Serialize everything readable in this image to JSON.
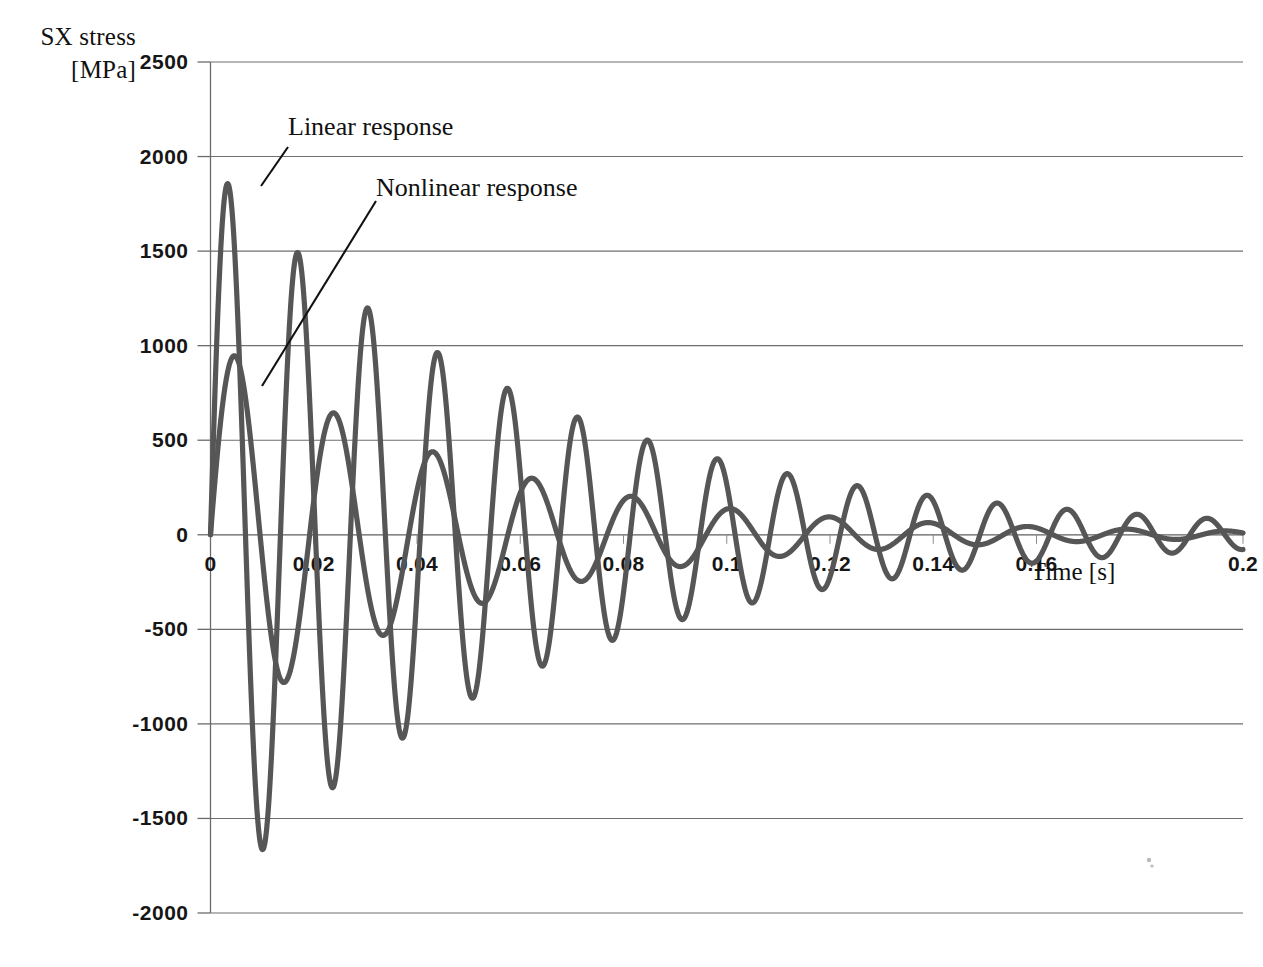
{
  "axes": {
    "y_title_line1": "SX stress",
    "y_title_line2": "[MPa]",
    "x_title": "Time [s]",
    "y_ticks": [
      "2500",
      "2000",
      "1500",
      "1000",
      "500",
      "0",
      "-500",
      "-1000",
      "-1500",
      "-2000"
    ],
    "x_ticks": [
      "0",
      "0.02",
      "0.04",
      "0.06",
      "0.08",
      "0.1",
      "0.12",
      "0.14",
      "0.16",
      "0.2"
    ]
  },
  "annotations": {
    "linear": "Linear response",
    "nonlinear": "Nonlinear response"
  },
  "chart_data": {
    "type": "line",
    "title": "",
    "xlabel": "Time [s]",
    "ylabel": "SX stress [MPa]",
    "xlim": [
      0,
      0.2
    ],
    "ylim": [
      -2000,
      2500
    ],
    "xtick_values": [
      0,
      0.02,
      0.04,
      0.06,
      0.08,
      0.1,
      0.12,
      0.14,
      0.16,
      0.2
    ],
    "ytick_values": [
      2500,
      2000,
      1500,
      1000,
      500,
      0,
      -500,
      -1000,
      -1500,
      -2000
    ],
    "grid": "horizontal",
    "legend": "annotations with leader lines",
    "line_color": "#565656",
    "series": [
      {
        "name": "Linear response",
        "model": "damped_sine",
        "amplitude0": 1960,
        "period": 0.01355,
        "damping_time_constant": 0.062,
        "phase_deg": 0,
        "peaks": [
          {
            "t": 0.0095,
            "y": 1840
          },
          {
            "t": 0.0233,
            "y": -1570
          },
          {
            "t": 0.0302,
            "y": 1345
          },
          {
            "t": 0.0437,
            "y": -1145
          },
          {
            "t": 0.0438,
            "y": 1000
          },
          {
            "t": 0.0575,
            "y": -855
          },
          {
            "t": 0.0574,
            "y": 730
          },
          {
            "t": 0.071,
            "y": -630
          },
          {
            "t": 0.0708,
            "y": 535
          },
          {
            "t": 0.0845,
            "y": -455
          },
          {
            "t": 0.0845,
            "y": 390
          },
          {
            "t": 0.098,
            "y": -335
          },
          {
            "t": 0.098,
            "y": 285
          },
          {
            "t": 0.1115,
            "y": -240
          },
          {
            "t": 0.1118,
            "y": 205
          },
          {
            "t": 0.125,
            "y": -175
          },
          {
            "t": 0.1253,
            "y": 148
          },
          {
            "t": 0.1388,
            "y": -125
          },
          {
            "t": 0.139,
            "y": 107
          },
          {
            "t": 0.1523,
            "y": -90
          }
        ]
      },
      {
        "name": "Nonlinear response",
        "model": "damped_sine",
        "amplitude0": 1040,
        "period": 0.0192,
        "damping_time_constant": 0.05,
        "phase_deg": 0,
        "peaks": [
          {
            "t": 0.006,
            "y": 1000
          },
          {
            "t": 0.0155,
            "y": -215
          },
          {
            "t": 0.025,
            "y": 280
          },
          {
            "t": 0.0345,
            "y": -190
          },
          {
            "t": 0.0347,
            "y": 205
          },
          {
            "t": 0.0443,
            "y": -150
          },
          {
            "t": 0.044,
            "y": 148
          },
          {
            "t": 0.0537,
            "y": -115
          },
          {
            "t": 0.0537,
            "y": 140
          },
          {
            "t": 0.0632,
            "y": -105
          },
          {
            "t": 0.0633,
            "y": 95
          },
          {
            "t": 0.0728,
            "y": -80
          },
          {
            "t": 0.073,
            "y": 75
          },
          {
            "t": 0.0825,
            "y": -65
          },
          {
            "t": 0.0826,
            "y": 60
          }
        ]
      }
    ]
  }
}
